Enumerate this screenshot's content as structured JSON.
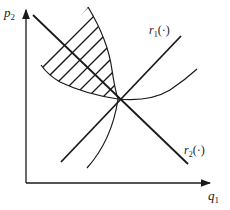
{
  "diagram": {
    "axes": {
      "y_label": "p",
      "y_label_sub": "2",
      "x_label": "q",
      "x_label_sub": "1"
    },
    "curves": [
      {
        "id": "r1",
        "label": "r",
        "label_sub": "1",
        "label_suffix": "(·)",
        "type": "reaction-line",
        "slope": "upward"
      },
      {
        "id": "r2",
        "label": "r",
        "label_sub": "2",
        "label_suffix": "(·)",
        "type": "reaction-line",
        "slope": "downward"
      },
      {
        "id": "iso-upper",
        "type": "isoprofit-curve"
      },
      {
        "id": "iso-lower",
        "type": "isoprofit-curve"
      }
    ],
    "regions": [
      {
        "id": "pareto-lens",
        "fill": "hatched",
        "description": "hatched region between two isoprofit curves above intersection"
      }
    ],
    "colors": {
      "line": "#1a1a1a",
      "background": "#ffffff"
    }
  }
}
